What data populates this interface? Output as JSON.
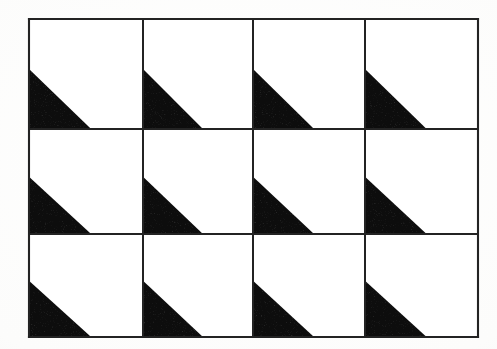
{
  "figure": {
    "background_color": "#fdfdfc",
    "ink_color": "#0d0d0d",
    "line_color": "#232323",
    "grid": {
      "columns": 4,
      "rows": 3,
      "cell_count": 12,
      "outline_stroke_width": 2.1,
      "divider_stroke_width": 2.0,
      "origin_x": 29,
      "origin_y": 19,
      "width": 449,
      "height": 318,
      "column_edges": [
        0,
        114,
        224,
        336,
        449
      ],
      "row_edges": [
        0,
        110,
        215,
        318
      ]
    },
    "motif": {
      "shape_name": "right-triangle",
      "orientation": "lower-left",
      "vertical_leg_fraction": 0.545,
      "horizontal_leg_fraction": 0.545,
      "fill": "#0d0d0d",
      "repeat": "identical in every cell"
    },
    "cells": [
      {
        "row": 0,
        "col": 0,
        "name": "cell-r1c1",
        "has_triangle": true
      },
      {
        "row": 0,
        "col": 1,
        "name": "cell-r1c2",
        "has_triangle": true
      },
      {
        "row": 0,
        "col": 2,
        "name": "cell-r1c3",
        "has_triangle": true
      },
      {
        "row": 0,
        "col": 3,
        "name": "cell-r1c4",
        "has_triangle": true
      },
      {
        "row": 1,
        "col": 0,
        "name": "cell-r2c1",
        "has_triangle": true
      },
      {
        "row": 1,
        "col": 1,
        "name": "cell-r2c2",
        "has_triangle": true
      },
      {
        "row": 1,
        "col": 2,
        "name": "cell-r2c3",
        "has_triangle": true
      },
      {
        "row": 1,
        "col": 3,
        "name": "cell-r2c4",
        "has_triangle": true
      },
      {
        "row": 2,
        "col": 0,
        "name": "cell-r3c1",
        "has_triangle": true
      },
      {
        "row": 2,
        "col": 1,
        "name": "cell-r3c2",
        "has_triangle": true
      },
      {
        "row": 2,
        "col": 2,
        "name": "cell-r3c3",
        "has_triangle": true
      },
      {
        "row": 2,
        "col": 3,
        "name": "cell-r3c4",
        "has_triangle": true
      }
    ]
  }
}
